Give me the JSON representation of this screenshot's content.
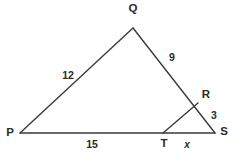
{
  "figure": {
    "background_color": "#ffffff",
    "stroke_color": "#3a3a3a",
    "text_color": "#2b2b2b",
    "vertices": [
      {
        "name": "P",
        "label": "P",
        "x": 20,
        "y": 133,
        "label_x": 10,
        "label_y": 133
      },
      {
        "name": "Q",
        "label": "Q",
        "x": 133,
        "y": 28,
        "label_x": 133,
        "label_y": 9
      },
      {
        "name": "R",
        "label": "R",
        "x": 198,
        "y": 103,
        "label_x": 206,
        "label_y": 95
      },
      {
        "name": "S",
        "label": "S",
        "x": 215,
        "y": 133,
        "label_x": 224,
        "label_y": 132
      },
      {
        "name": "T",
        "label": "T",
        "x": 163,
        "y": 133,
        "label_x": 164,
        "label_y": 144
      }
    ],
    "segments": [
      {
        "name": "segment-PQ",
        "from": "P",
        "to": "Q"
      },
      {
        "name": "segment-QS",
        "from": "Q",
        "to": "S"
      },
      {
        "name": "segment-PS",
        "from": "P",
        "to": "S"
      },
      {
        "name": "segment-RT",
        "from": "R",
        "to": "T"
      }
    ],
    "measures": [
      {
        "name": "length-PQ",
        "text": "12",
        "x": 68,
        "y": 75,
        "italic": false
      },
      {
        "name": "length-QR",
        "text": "9",
        "x": 172,
        "y": 57,
        "italic": false
      },
      {
        "name": "length-RS",
        "text": "3",
        "x": 214,
        "y": 115,
        "italic": false
      },
      {
        "name": "length-PT",
        "text": "15",
        "x": 92,
        "y": 144,
        "italic": false
      },
      {
        "name": "length-TS",
        "text": "x",
        "x": 187,
        "y": 145,
        "italic": true
      }
    ]
  }
}
